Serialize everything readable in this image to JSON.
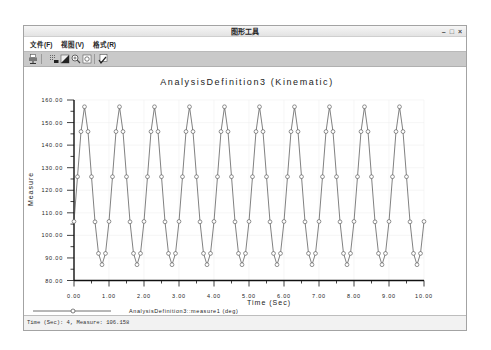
{
  "window": {
    "title": "图形工具",
    "controls": {
      "minimize": "–",
      "maximize": "□",
      "close": "×"
    }
  },
  "menu": {
    "items": [
      {
        "label": "文件(F)"
      },
      {
        "label": "视图(V)"
      },
      {
        "label": "格式(R)"
      }
    ]
  },
  "toolbar": {
    "icons": [
      "print-icon",
      "grid-format-icon",
      "fill-color-icon",
      "zoom-in-icon",
      "zoom-fit-icon",
      "edit-check-icon"
    ]
  },
  "status": {
    "text": "Time (Sec): 4, Measure: 106.158"
  },
  "colors": {
    "line": "#4a4a4a",
    "axis": "#111111",
    "grid": "#f0f0f0",
    "toolbar": "#c9c9c9"
  },
  "chart_data": {
    "type": "line",
    "title": "AnalysisDefinition3 (Kinematic)",
    "xlabel": "Time (Sec)",
    "ylabel": "Measure",
    "xlim": [
      0,
      10
    ],
    "ylim": [
      80,
      160
    ],
    "grid": true,
    "legend_position": "bottom-left",
    "x_ticks": [
      "0.00",
      "1.00",
      "2.00",
      "3.00",
      "4.00",
      "5.00",
      "6.00",
      "7.00",
      "8.00",
      "9.00",
      "10.00"
    ],
    "y_ticks": [
      "80.00",
      "90.00",
      "100.00",
      "110.00",
      "120.00",
      "130.00",
      "140.00",
      "150.00",
      "160.00"
    ],
    "series": [
      {
        "name": "AnalysisDefinition3::measure1 (deg)",
        "marker": "circle",
        "x": [
          0.0,
          0.1,
          0.2,
          0.3,
          0.4,
          0.5,
          0.6,
          0.7,
          0.8,
          0.9,
          1.0,
          1.1,
          1.2,
          1.3,
          1.4,
          1.5,
          1.6,
          1.7,
          1.8,
          1.9,
          2.0,
          2.1,
          2.2,
          2.3,
          2.4,
          2.5,
          2.6,
          2.7,
          2.8,
          2.9,
          3.0,
          3.1,
          3.2,
          3.3,
          3.4,
          3.5,
          3.6,
          3.7,
          3.8,
          3.9,
          4.0,
          4.1,
          4.2,
          4.3,
          4.4,
          4.5,
          4.6,
          4.7,
          4.8,
          4.9,
          5.0,
          5.1,
          5.2,
          5.3,
          5.4,
          5.5,
          5.6,
          5.7,
          5.8,
          5.9,
          6.0,
          6.1,
          6.2,
          6.3,
          6.4,
          6.5,
          6.6,
          6.7,
          6.8,
          6.9,
          7.0,
          7.1,
          7.2,
          7.3,
          7.4,
          7.5,
          7.6,
          7.7,
          7.8,
          7.9,
          8.0,
          8.1,
          8.2,
          8.3,
          8.4,
          8.5,
          8.6,
          8.7,
          8.8,
          8.9,
          9.0,
          9.1,
          9.2,
          9.3,
          9.4,
          9.5,
          9.6,
          9.7,
          9.8,
          9.9,
          10.0
        ],
        "values": [
          106.16,
          126,
          146,
          157,
          146,
          126,
          106,
          92,
          87,
          92,
          106.16,
          126,
          146,
          157,
          146,
          126,
          106,
          92,
          87,
          92,
          106.16,
          126,
          146,
          157,
          146,
          126,
          106,
          92,
          87,
          92,
          106.16,
          126,
          146,
          157,
          146,
          126,
          106,
          92,
          87,
          92,
          106.16,
          126,
          146,
          157,
          146,
          126,
          106,
          92,
          87,
          92,
          106.16,
          126,
          146,
          157,
          146,
          126,
          106,
          92,
          87,
          92,
          106.16,
          126,
          146,
          157,
          146,
          126,
          106,
          92,
          87,
          92,
          106.16,
          126,
          146,
          157,
          146,
          126,
          106,
          92,
          87,
          92,
          106.16,
          126,
          146,
          157,
          146,
          126,
          106,
          92,
          87,
          92,
          106.16,
          126,
          146,
          157,
          146,
          126,
          106,
          92,
          87,
          92,
          106.16
        ]
      }
    ]
  }
}
